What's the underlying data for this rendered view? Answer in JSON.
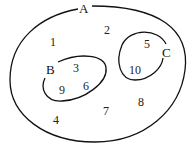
{
  "diagram": {
    "type": "venn",
    "universe": {
      "label": "A",
      "elements_outside_subsets": [
        "1",
        "2",
        "4",
        "7",
        "8"
      ]
    },
    "sets": [
      {
        "label": "B",
        "elements": [
          "3",
          "9",
          "6"
        ]
      },
      {
        "label": "C",
        "elements": [
          "5",
          "10"
        ]
      }
    ],
    "labels": {
      "A": "A",
      "B": "B",
      "C": "C",
      "n1": "1",
      "n2": "2",
      "n3": "3",
      "n4": "4",
      "n5": "5",
      "n6": "6",
      "n7": "7",
      "n8": "8",
      "n9": "9",
      "n10": "10"
    },
    "stroke_color": "#111111"
  }
}
